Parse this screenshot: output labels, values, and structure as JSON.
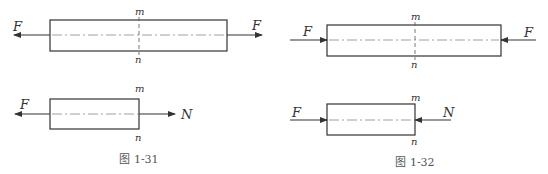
{
  "figures": [
    {
      "caption": "图 1-31",
      "top": {
        "left_force": "F",
        "right_force": "F",
        "section_top": "m",
        "section_bottom": "n"
      },
      "bottom": {
        "left_force": "F",
        "internal_force": "N",
        "section_top": "m",
        "section_bottom": "n"
      }
    },
    {
      "caption": "图 1-32",
      "top": {
        "left_force": "F",
        "right_force": "F",
        "section_top": "m",
        "section_bottom": "n"
      },
      "bottom": {
        "left_force": "F",
        "internal_force": "N",
        "section_top": "m",
        "section_bottom": "n"
      }
    }
  ],
  "colors": {
    "line": "#333333",
    "centerline": "#777777"
  }
}
